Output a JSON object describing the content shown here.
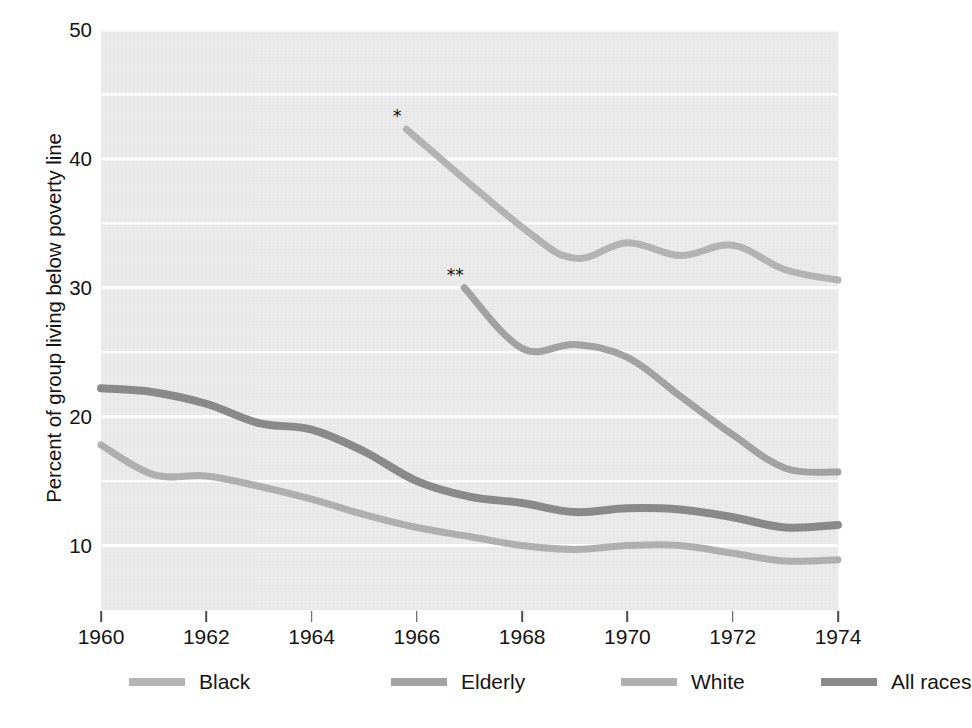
{
  "chart_data": {
    "type": "line",
    "title": "",
    "xlabel": "",
    "ylabel": "Percent of group living below poverty line",
    "xlim": [
      1960,
      1974
    ],
    "ylim": [
      5,
      50
    ],
    "grid": "horizontal",
    "legend_position": "bottom",
    "xticks": [
      1960,
      1962,
      1964,
      1966,
      1968,
      1970,
      1972,
      1974
    ],
    "xtick_labels": [
      "1960",
      "1962",
      "1964",
      "1966",
      "1968",
      "1970",
      "1972",
      "1974"
    ],
    "yticks": [
      10,
      20,
      30,
      40,
      50
    ],
    "ytick_labels": [
      "10",
      "20",
      "30",
      "40",
      "50"
    ],
    "gridlines": [
      10,
      15,
      20,
      25,
      30,
      35,
      40,
      45,
      50
    ],
    "series": [
      {
        "name": "Black",
        "color": "#b4b4b4",
        "linewidth": 7,
        "x": [
          1965.8,
          1968,
          1969,
          1970,
          1971,
          1972,
          1973,
          1974
        ],
        "values": [
          42.3,
          34.7,
          32.3,
          33.5,
          32.5,
          33.3,
          31.4,
          30.6
        ],
        "start_marker": "*"
      },
      {
        "name": "Elderly",
        "color": "#a3a3a3",
        "linewidth": 7,
        "x": [
          1966.9,
          1968,
          1969,
          1970,
          1971,
          1972,
          1973,
          1974
        ],
        "values": [
          30.0,
          25.3,
          25.6,
          24.6,
          21.6,
          18.6,
          16.0,
          15.7
        ],
        "start_marker": "**"
      },
      {
        "name": "White",
        "color": "#b0b0b0",
        "linewidth": 7,
        "x": [
          1960,
          1961,
          1962,
          1963,
          1964,
          1965,
          1966,
          1967,
          1968,
          1969,
          1970,
          1971,
          1972,
          1973,
          1974
        ],
        "values": [
          17.8,
          15.5,
          15.4,
          14.6,
          13.6,
          12.4,
          11.4,
          10.7,
          10.0,
          9.7,
          10.0,
          10.0,
          9.4,
          8.8,
          8.9
        ],
        "start_marker": ""
      },
      {
        "name": "All races",
        "color": "#8a8a8a",
        "linewidth": 8,
        "x": [
          1960,
          1961,
          1962,
          1963,
          1964,
          1965,
          1966,
          1967,
          1968,
          1969,
          1970,
          1971,
          1972,
          1973,
          1974
        ],
        "values": [
          22.2,
          21.9,
          21.0,
          19.5,
          19.0,
          17.3,
          15.0,
          13.8,
          13.3,
          12.6,
          12.9,
          12.8,
          12.2,
          11.4,
          11.6
        ],
        "start_marker": ""
      }
    ],
    "annotations": [
      {
        "text": "*",
        "series": "Black",
        "x": 1965.8,
        "y": 42.3
      },
      {
        "text": "**",
        "series": "Elderly",
        "x": 1966.9,
        "y": 30.0
      }
    ],
    "plot_background": "#ebebeb",
    "gridline_color": "#ffffff",
    "legend": [
      {
        "label": "Black",
        "color": "#b4b4b4"
      },
      {
        "label": "Elderly",
        "color": "#a3a3a3"
      },
      {
        "label": "White",
        "color": "#b0b0b0"
      },
      {
        "label": "All races",
        "color": "#8a8a8a"
      }
    ]
  }
}
